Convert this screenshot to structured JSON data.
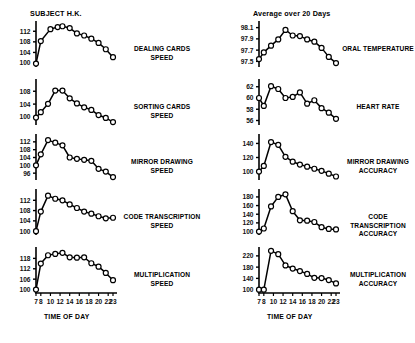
{
  "figure": {
    "columns": [
      {
        "title": "SUBJECT H.K."
      },
      {
        "title": "Average over 20 Days"
      }
    ],
    "x_axis_title": "TIME OF DAY",
    "x_ticks": [
      7,
      8,
      10,
      12,
      14,
      16,
      18,
      20,
      22,
      23
    ],
    "x_range": [
      7,
      23
    ]
  },
  "chart_data": [
    {
      "type": "line",
      "title": "DEALING CARDS\nSPEED",
      "label": "DEALING CARDS SPEED",
      "column": "SUBJECT H.K.",
      "xlabel": "TIME OF DAY",
      "ylabel": "",
      "grid": false,
      "legend": "none",
      "xlim": [
        7,
        23
      ],
      "ylim": [
        98.5,
        115.5
      ],
      "yticks": [
        100,
        104,
        108,
        112
      ],
      "x": [
        7,
        8,
        10,
        11.5,
        12.5,
        14,
        15.5,
        17,
        18.5,
        20,
        21.5,
        23
      ],
      "y": [
        99.8,
        108.3,
        112.8,
        113.6,
        113.9,
        113.2,
        111.2,
        110.4,
        109.2,
        107.6,
        105.2,
        102.2
      ]
    },
    {
      "type": "line",
      "title": "ORAL TEMPERATURE",
      "label": "ORAL TEMPERATURE",
      "column": "Average over 20 Days",
      "xlabel": "TIME OF DAY",
      "ylabel": "",
      "grid": false,
      "legend": "none",
      "xlim": [
        7,
        23
      ],
      "ylim": [
        97.4,
        98.2
      ],
      "yticks": [
        97.5,
        97.7,
        97.9,
        98.1
      ],
      "x": [
        7,
        8,
        9.5,
        11,
        12.5,
        14,
        15.5,
        17,
        18.5,
        20,
        21.5,
        23
      ],
      "y": [
        97.54,
        97.66,
        97.78,
        97.89,
        98.06,
        97.96,
        97.95,
        97.89,
        97.85,
        97.74,
        97.58,
        97.47
      ]
    },
    {
      "type": "line",
      "title": "SORTING CARDS\nSPEED",
      "label": "SORTING CARDS SPEED",
      "column": "SUBJECT H.K.",
      "xlabel": "TIME OF DAY",
      "ylabel": "",
      "grid": false,
      "legend": "none",
      "xlim": [
        7,
        23
      ],
      "ylim": [
        97.5,
        111.5
      ],
      "yticks": [
        100,
        104,
        108
      ],
      "x": [
        7,
        8,
        9.5,
        11,
        12.5,
        14,
        15.5,
        17,
        18.5,
        20,
        21.5,
        23
      ],
      "y": [
        99.8,
        101.5,
        104.1,
        108.2,
        108.2,
        105.8,
        104.2,
        103.0,
        102.2,
        100.6,
        99.7,
        98.4
      ]
    },
    {
      "type": "line",
      "title": "HEART RATE",
      "label": "HEART RATE",
      "column": "Average over 20 Days",
      "xlabel": "TIME OF DAY",
      "ylabel": "",
      "grid": false,
      "legend": "none",
      "xlim": [
        7,
        23
      ],
      "ylim": [
        55.2,
        63.2
      ],
      "yticks": [
        56,
        58,
        60,
        62
      ],
      "x": [
        7,
        8,
        9.5,
        11,
        12.5,
        14,
        15.5,
        17,
        18.5,
        20,
        21.5,
        23
      ],
      "y": [
        60.0,
        58.6,
        62.1,
        61.6,
        60.0,
        60.2,
        61.0,
        59.0,
        59.6,
        58.2,
        57.4,
        56.3
      ]
    },
    {
      "type": "line",
      "title": "MIRROR DRAWING\nSPEED",
      "label": "MIRROR DRAWING SPEED",
      "column": "SUBJECT H.K.",
      "xlabel": "TIME OF DAY",
      "ylabel": "",
      "grid": false,
      "legend": "none",
      "xlim": [
        7,
        23
      ],
      "ylim": [
        92.5,
        115.5
      ],
      "yticks": [
        96,
        100,
        104,
        108,
        112
      ],
      "x": [
        7,
        8,
        9.5,
        11,
        12.5,
        14,
        15.5,
        17,
        18.5,
        20,
        21.5,
        23
      ],
      "y": [
        100.0,
        105.6,
        112.9,
        111.6,
        110.2,
        104.0,
        103.3,
        102.8,
        102.3,
        98.2,
        96.8,
        94.0
      ]
    },
    {
      "type": "line",
      "title": "MIRROR DRAWING\nACCURACY",
      "label": "MIRROR DRAWING ACCURACY",
      "column": "Average over 20 Days",
      "xlabel": "TIME OF DAY",
      "ylabel": "",
      "grid": false,
      "legend": "none",
      "xlim": [
        7,
        23
      ],
      "ylim": [
        88,
        152
      ],
      "yticks": [
        100,
        120,
        140
      ],
      "x": [
        7,
        8,
        9.5,
        11,
        12.5,
        14,
        15.5,
        17,
        18.5,
        20,
        21.5,
        23
      ],
      "y": [
        100.0,
        108.0,
        142.0,
        138.0,
        121.0,
        114.0,
        110.0,
        107.0,
        104.0,
        101.0,
        97.0,
        93.0
      ]
    },
    {
      "type": "line",
      "title": "CODE TRANSCRIPTION\nSPEED",
      "label": "CODE TRANSCRIPTION SPEED",
      "column": "SUBJECT H.K.",
      "xlabel": "TIME OF DAY",
      "ylabel": "",
      "grid": false,
      "legend": "none",
      "xlim": [
        7,
        23
      ],
      "ylim": [
        98.5,
        116
      ],
      "yticks": [
        100,
        104,
        108,
        112
      ],
      "x": [
        7,
        8,
        9.5,
        11,
        12.5,
        14,
        15.5,
        17,
        18.5,
        20,
        21.5,
        23
      ],
      "y": [
        100.0,
        107.6,
        113.8,
        112.6,
        112.0,
        110.4,
        109.0,
        107.6,
        106.8,
        105.8,
        105.0,
        105.2
      ]
    },
    {
      "type": "line",
      "title": "CODE TRANSCRIPTION\nACCURACY",
      "label": "CODE TRANSCRIPTION ACCURACY",
      "column": "Average over 20 Days",
      "xlabel": "TIME OF DAY",
      "ylabel": "",
      "grid": false,
      "legend": "none",
      "xlim": [
        7,
        23
      ],
      "ylim": [
        92,
        196
      ],
      "yticks": [
        100,
        120,
        140,
        160,
        180
      ],
      "x": [
        7,
        8,
        9.5,
        11,
        12.5,
        14,
        15.5,
        17,
        18.5,
        20,
        21.5,
        23
      ],
      "y": [
        100.0,
        107.0,
        158.0,
        180.0,
        186.0,
        147.0,
        126.0,
        125.0,
        122.0,
        110.0,
        106.0,
        105.0
      ]
    },
    {
      "type": "line",
      "title": "MULTIPLICATION\nSPEED",
      "label": "MULTIPLICATION SPEED",
      "column": "SUBJECT H.K.",
      "xlabel": "TIME OF DAY",
      "ylabel": "",
      "grid": false,
      "legend": "none",
      "xlim": [
        7,
        23
      ],
      "ylim": [
        98,
        124
      ],
      "yticks": [
        100,
        106,
        112,
        118
      ],
      "x": [
        7,
        8,
        9.5,
        11,
        12.5,
        14,
        15.5,
        17,
        18.5,
        20,
        21.5,
        23
      ],
      "y": [
        100.0,
        115.0,
        119.8,
        120.6,
        121.2,
        118.6,
        118.4,
        118.6,
        115.2,
        113.2,
        109.6,
        105.4
      ]
    },
    {
      "type": "line",
      "title": "MULTIPLICATION\nACCURACY",
      "label": "MULTIPLICATION ACCURACY",
      "column": "Average over 20 Days",
      "xlabel": "TIME OF DAY",
      "ylabel": "",
      "grid": false,
      "legend": "none",
      "xlim": [
        7,
        23
      ],
      "ylim": [
        88,
        248
      ],
      "yticks": [
        100,
        140,
        180,
        220
      ],
      "x": [
        7,
        8,
        9.5,
        11,
        12.5,
        14,
        15.5,
        17,
        18.5,
        20,
        21.5,
        23
      ],
      "y": [
        100.0,
        100.0,
        238.0,
        226.0,
        186.0,
        175.0,
        166.0,
        156.0,
        142.0,
        141.0,
        134.0,
        122.0
      ]
    }
  ]
}
